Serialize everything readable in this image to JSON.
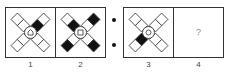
{
  "puzzle": {
    "groups": [
      {
        "x": 5,
        "y": 7,
        "panel_w": 50,
        "panel_h": 50,
        "panels": [
          0,
          1
        ]
      },
      {
        "x": 123,
        "y": 7,
        "panel_w": 50,
        "panel_h": 50,
        "panels": [
          2,
          3
        ]
      }
    ],
    "separator_dots": [
      {
        "x": 114,
        "y": 20
      },
      {
        "x": 114,
        "y": 45
      }
    ],
    "panels": [
      {
        "label": "1",
        "center_symbol": "house",
        "arms": {
          "upper_left": {
            "outer": "white",
            "inner": "white"
          },
          "upper_right": {
            "outer": "white",
            "inner": "black"
          },
          "lower_left": {
            "outer": "white",
            "inner": "white"
          },
          "lower_right": {
            "outer": "white",
            "inner": "white"
          }
        }
      },
      {
        "label": "2",
        "center_symbol": "square",
        "arms": {
          "upper_left": {
            "outer": "white",
            "inner": "black"
          },
          "upper_right": {
            "outer": "black",
            "inner": "white"
          },
          "lower_left": {
            "outer": "black",
            "inner": "white"
          },
          "lower_right": {
            "outer": "black",
            "inner": "white"
          }
        }
      },
      {
        "label": "3",
        "center_symbol": "circle",
        "arms": {
          "upper_left": {
            "outer": "white",
            "inner": "white"
          },
          "upper_right": {
            "outer": "white",
            "inner": "white"
          },
          "lower_left": {
            "outer": "white",
            "inner": "black"
          },
          "lower_right": {
            "outer": "white",
            "inner": "white"
          }
        }
      },
      {
        "label": "4",
        "question": "?",
        "empty": true
      }
    ],
    "colors": {
      "stroke": "#333333",
      "fill_black": "#111111",
      "fill_white": "#ffffff",
      "question": "#888888",
      "label": "#444444"
    }
  }
}
